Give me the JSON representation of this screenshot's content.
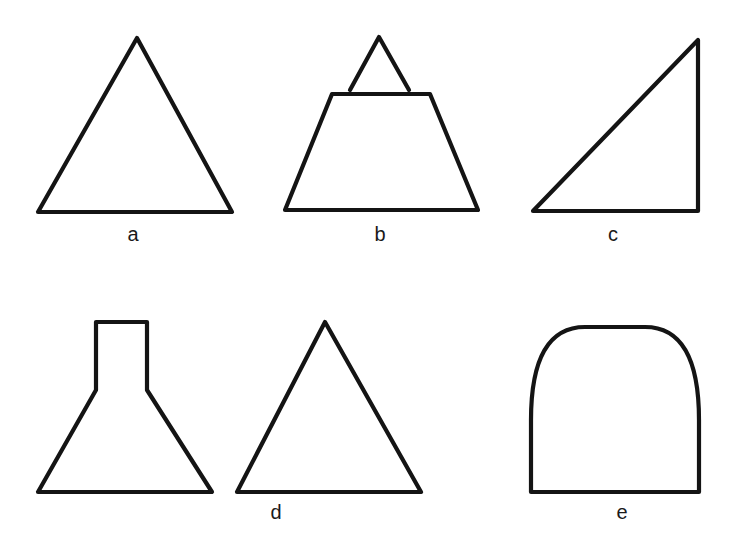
{
  "figure": {
    "background_color": "#ffffff",
    "stroke_color": "#141414",
    "label_color": "#1a1a1a",
    "canvas": {
      "width": 739,
      "height": 541
    },
    "caption_letters": [
      "a",
      "b",
      "c",
      "d",
      "e"
    ],
    "rows": 2,
    "columns": 3
  },
  "shapes": [
    {
      "id": "shape-a",
      "label": "a",
      "name": "equilateral-triangle",
      "label_x": 133,
      "label_y": 234,
      "points": "137,38 232,212 38,212",
      "closed": true,
      "geometry": {
        "apex": [
          137,
          38
        ],
        "base_left": [
          38,
          212
        ],
        "base_right": [
          232,
          212
        ],
        "width": 194,
        "height": 174
      }
    },
    {
      "id": "shape-b",
      "label": "b",
      "name": "truncated-triangle-with-detached-apex",
      "label_x": 380,
      "label_y": 234,
      "trapezoid_points": "332,94 430,94 478,210 285,210",
      "apex_points": "350,90 379,37 409,90",
      "closed": true,
      "geometry": {
        "apex": [
          379,
          37
        ],
        "apex_left_foot": [
          350,
          90
        ],
        "apex_right_foot": [
          409,
          90
        ],
        "top_left": [
          332,
          94
        ],
        "top_right": [
          430,
          94
        ],
        "base_left": [
          285,
          210
        ],
        "base_right": [
          478,
          210
        ]
      }
    },
    {
      "id": "shape-c",
      "label": "c",
      "name": "right-triangle",
      "label_x": 613,
      "label_y": 234,
      "points": "698,40 698,211 533,211",
      "closed": true,
      "geometry": {
        "apex": [
          698,
          40
        ],
        "base_left": [
          533,
          211
        ],
        "base_right": [
          698,
          211
        ],
        "right_angle_corner": [
          698,
          211
        ]
      }
    },
    {
      "id": "shape-d",
      "label": "d",
      "name": "flask-funnel-shape",
      "label_x": 276,
      "label_y": 512,
      "points": "96,322 147,322 147,390 212,492 38,492 96,390",
      "closed": true,
      "geometry": {
        "neck_top_left": [
          96,
          322
        ],
        "neck_top_right": [
          147,
          322
        ],
        "neck_bottom_right": [
          147,
          390
        ],
        "neck_bottom_left": [
          96,
          390
        ],
        "base_left": [
          38,
          492
        ],
        "base_right": [
          212,
          492
        ]
      }
    },
    {
      "id": "shape-d2",
      "label": "",
      "name": "equilateral-triangle-unlabeled",
      "label_x": null,
      "label_y": null,
      "points": "325,322 421,492 237,492",
      "closed": true,
      "geometry": {
        "apex": [
          325,
          322
        ],
        "base_left": [
          237,
          492
        ],
        "base_right": [
          421,
          492
        ],
        "width": 184,
        "height": 170
      }
    },
    {
      "id": "shape-e",
      "label": "e",
      "name": "parabolic-dome-shape",
      "label_x": 622,
      "label_y": 512,
      "path": "M531,492 L531,420 C531,360 548,327 585,327 L645,327 C682,327 699,360 699,420 L699,492 Z",
      "closed": true,
      "geometry": {
        "base_left": [
          531,
          492
        ],
        "base_right": [
          699,
          492
        ],
        "apex_y": 326,
        "width": 168,
        "height": 166
      }
    }
  ]
}
